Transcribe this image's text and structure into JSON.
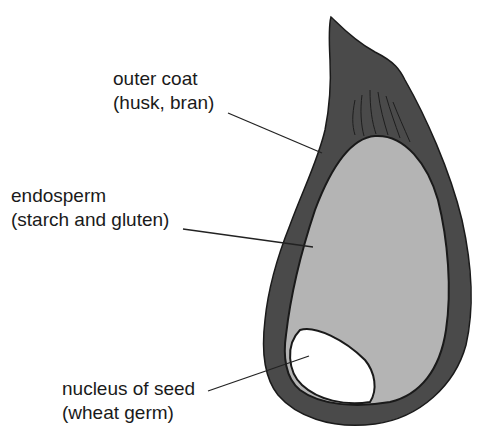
{
  "diagram": {
    "labels": [
      {
        "id": "outer-coat",
        "line1": "outer coat",
        "line2": "(husk, bran)"
      },
      {
        "id": "endosperm",
        "line1": "endosperm",
        "line2": "(starch and gluten)"
      },
      {
        "id": "germ",
        "line1": "nucleus of seed",
        "line2": "(wheat germ)"
      }
    ],
    "colors": {
      "outer_coat": "#4a4a4a",
      "endosperm": "#b4b4b4",
      "germ": "#ffffff",
      "outline": "#1a1a1a",
      "leader_line": "#222222"
    }
  }
}
